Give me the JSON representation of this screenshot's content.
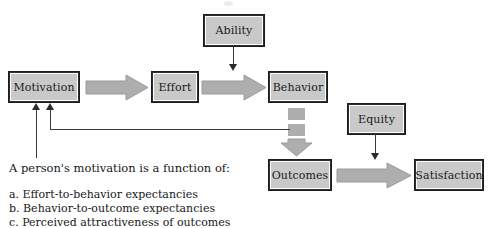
{
  "diagram": {
    "type": "flowchart",
    "title_visible": false,
    "colors": {
      "box_fill": "#c9c9c9",
      "box_border": "#2e2e2e",
      "block_arrow_fill": "#aeaeae",
      "thin_line": "#3a3a3a",
      "text": "#171717",
      "background": "#ffffff"
    },
    "nodes": [
      {
        "id": "motivation",
        "label": "Motivation"
      },
      {
        "id": "effort",
        "label": "Effort"
      },
      {
        "id": "behavior",
        "label": "Behavior"
      },
      {
        "id": "ability",
        "label": "Ability"
      },
      {
        "id": "outcomes",
        "label": "Outcomes"
      },
      {
        "id": "equity",
        "label": "Equity"
      },
      {
        "id": "satisfaction",
        "label": "Satisfaction"
      }
    ],
    "edges": [
      {
        "from": "motivation",
        "to": "effort",
        "style": "block-arrow",
        "direction": "right"
      },
      {
        "from": "effort",
        "to": "behavior",
        "style": "block-arrow",
        "direction": "right"
      },
      {
        "from": "ability",
        "to": "behavior",
        "style": "thin-arrow",
        "direction": "down"
      },
      {
        "from": "behavior",
        "to": "outcomes",
        "style": "segmented-block-arrow",
        "direction": "down"
      },
      {
        "from": "outcomes",
        "to": "satisfaction",
        "style": "block-arrow",
        "direction": "right"
      },
      {
        "from": "equity",
        "to": "satisfaction",
        "style": "thin-arrow",
        "direction": "down"
      },
      {
        "from": "behavior",
        "to": "motivation",
        "style": "feedback-line",
        "direction": "left-up"
      },
      {
        "from": "caption",
        "to": "motivation",
        "style": "thin-arrow",
        "direction": "up"
      }
    ]
  },
  "caption": {
    "heading": "A person's motivation is a function of:",
    "items": [
      "a. Effort-to-behavior expectancies",
      "b. Behavior-to-outcome expectancies",
      "c. Perceived attractiveness of outcomes"
    ]
  }
}
